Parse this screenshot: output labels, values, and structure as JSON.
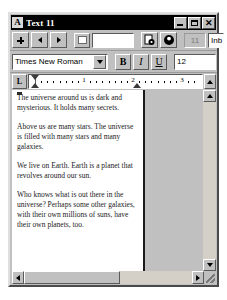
{
  "window": {
    "title": "Text 11",
    "app_icon": "A",
    "controls": {
      "minimize_label": "_",
      "maximize_label": "□",
      "close_label": "✕"
    }
  },
  "toolbar_nav": {
    "insert_button": "+",
    "prev_button": "◄",
    "next_button": "►",
    "color_swatch_color": "#ffffff",
    "doc_name_value": "",
    "doc_name_placeholder": "",
    "icon_button_1": "print-preview-icon",
    "icon_button_2": "help-icon",
    "count_value": "11",
    "inbox_value": "Inb"
  },
  "toolbar_format": {
    "font_name": "Times New Roman",
    "font_dropdown_icon": "chevron-down-icon",
    "bold_label": "B",
    "italic_label": "I",
    "underline_label": "U",
    "font_size": "12"
  },
  "ruler": {
    "tabstop_label": "L",
    "numbers": [
      "1",
      "2",
      "3"
    ],
    "unit": "inches",
    "scroll_up_icon": "triangle-up-icon"
  },
  "document": {
    "paragraphs": [
      "The universe around us is dark and mysterious.  It holds many secrets.",
      "Above us are many stars.  The universe is filled with many stars and many galaxies.",
      "We live on Earth.  Earth is a planet that revolves around our sun.",
      "Who knows what is out there in the universe?  Perhaps some other galaxies, with their own millions of suns, have their own planets, too."
    ]
  },
  "scrollbars": {
    "v_up_icon": "triangle-up-icon",
    "v_down_icon": "triangle-down-icon",
    "h_left_icon": "triangle-left-icon",
    "h_right_icon": "triangle-right-icon",
    "resize_grip": "resize-grip-icon"
  },
  "colors": {
    "window_face": "#c0c0c0",
    "titlebar": "#000000",
    "titlebar_text": "#ffffff",
    "page": "#ffffff"
  }
}
